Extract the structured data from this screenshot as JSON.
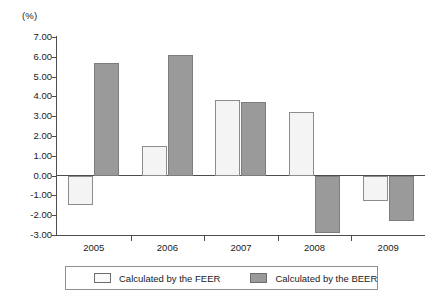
{
  "chart_data": {
    "type": "bar",
    "title": "",
    "xlabel": "",
    "ylabel": "(%)",
    "unit_label": "(%)",
    "categories": [
      "2005",
      "2006",
      "2007",
      "2008",
      "2009"
    ],
    "series": [
      {
        "name": "Calculated by the FEER",
        "color": "#f4f4f4",
        "values": [
          -1.5,
          1.5,
          3.8,
          3.2,
          -1.3
        ]
      },
      {
        "name": "Calculated by the BEER",
        "color": "#9a9a9a",
        "values": [
          5.7,
          6.1,
          3.7,
          -2.9,
          -2.3
        ]
      }
    ],
    "ylim": [
      -3.0,
      7.0
    ],
    "ytick_step": 1.0,
    "ytick_labels": [
      "7.00",
      "6.00",
      "5.00",
      "4.00",
      "3.00",
      "2.00",
      "1.00",
      "0.00",
      "-1.00",
      "-2.00",
      "-3.00"
    ],
    "grid": false,
    "legend_position": "bottom"
  },
  "legend": {
    "items": [
      {
        "label": "Calculated by the FEER",
        "swatch": "legend-swatch-feer"
      },
      {
        "label": "Calculated by the BEER",
        "swatch": "legend-swatch-beer"
      }
    ]
  }
}
